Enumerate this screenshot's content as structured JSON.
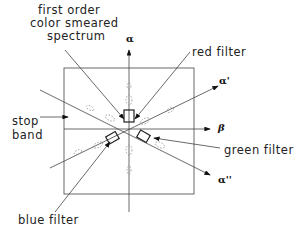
{
  "diagram": {
    "labels": {
      "first_order_line1": "first order",
      "first_order_line2": "color smeared",
      "first_order_line3": "spectrum",
      "red_filter": "red filter",
      "stop_band_line1": "stop",
      "stop_band_line2": "band",
      "green_filter": "green filter",
      "blue_filter": "blue filter"
    },
    "axes": {
      "alpha": "α",
      "alpha_prime": "α'",
      "alpha_double_prime": "α''",
      "beta": "β"
    },
    "colors": {
      "line": "#333333",
      "background": "#ffffff"
    }
  }
}
